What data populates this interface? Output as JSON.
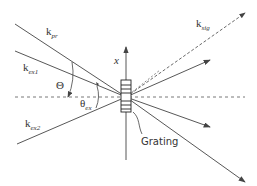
{
  "diagram": {
    "labels": {
      "k_pr": {
        "base": "k",
        "sub": "pr"
      },
      "k_ex1": {
        "base": "k",
        "sub": "ex1"
      },
      "k_ex2": {
        "base": "k",
        "sub": "ex2"
      },
      "k_sig": {
        "base": "k",
        "sub": "sig"
      },
      "theta_big": "Θ",
      "theta_ex": {
        "base": "θ",
        "sub": "ex"
      },
      "axis_x": "x",
      "grating": "Grating"
    },
    "colors": {
      "line": "#444444",
      "text": "#333333"
    }
  }
}
